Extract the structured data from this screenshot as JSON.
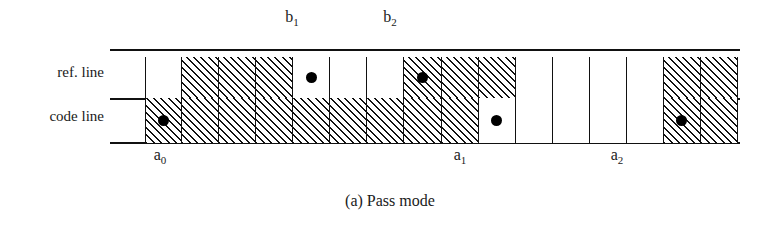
{
  "figure": {
    "caption": "(a) Pass mode",
    "rows": [
      {
        "id": "ref-line",
        "label": "ref. line",
        "cells": [
          {
            "fill": "white"
          },
          {
            "fill": "hatched"
          },
          {
            "fill": "hatched"
          },
          {
            "fill": "hatched"
          },
          {
            "fill": "white",
            "dot": true
          },
          {
            "fill": "white"
          },
          {
            "fill": "white"
          },
          {
            "fill": "hatched",
            "dot": true
          },
          {
            "fill": "hatched"
          },
          {
            "fill": "hatched"
          },
          {
            "fill": "white"
          },
          {
            "fill": "white"
          },
          {
            "fill": "white"
          },
          {
            "fill": "white"
          },
          {
            "fill": "hatched"
          },
          {
            "fill": "hatched"
          }
        ]
      },
      {
        "id": "code-line",
        "label": "code line",
        "cells": [
          {
            "fill": "hatched",
            "dot": true
          },
          {
            "fill": "hatched"
          },
          {
            "fill": "hatched"
          },
          {
            "fill": "hatched"
          },
          {
            "fill": "hatched"
          },
          {
            "fill": "hatched"
          },
          {
            "fill": "hatched"
          },
          {
            "fill": "hatched"
          },
          {
            "fill": "hatched"
          },
          {
            "fill": "white",
            "dot": true
          },
          {
            "fill": "white"
          },
          {
            "fill": "white"
          },
          {
            "fill": "white"
          },
          {
            "fill": "white"
          },
          {
            "fill": "hatched",
            "dot": true
          },
          {
            "fill": "hatched"
          }
        ]
      }
    ],
    "annotations": {
      "b1": {
        "base": "b",
        "sub": "1"
      },
      "b2": {
        "base": "b",
        "sub": "2"
      },
      "a0": {
        "base": "a",
        "sub": "0"
      },
      "a1": {
        "base": "a",
        "sub": "1"
      },
      "a2": {
        "base": "a",
        "sub": "2"
      }
    },
    "colors": {
      "ink": "#111111",
      "paper": "#ffffff",
      "dot": "#000000"
    },
    "cell_count": 16
  }
}
